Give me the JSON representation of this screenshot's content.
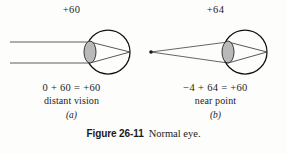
{
  "figure": {
    "number_label": "Figure 26-11",
    "caption_text": "Normal eye.",
    "colors": {
      "ink": "#1c1c1c",
      "outline": "#111111",
      "ray": "#4a4a4a",
      "lens_fill": "#b9b9b9",
      "lens_stroke": "#3a3a3a",
      "page_background": "#fdfdfc"
    }
  },
  "panels": [
    {
      "id": "a",
      "letter": "(a)",
      "power_label": "+60",
      "equation": "0 + 60 = +60",
      "subcaption": "distant vision",
      "ray_source": "parallel-rays",
      "geometry": {
        "eye_center_x": 108,
        "eye_center_y": 32,
        "eye_radius": 22,
        "lens_center_x": 90,
        "lens_rx": 6,
        "lens_ry": 11,
        "focus_x": 130,
        "focus_y": 32,
        "ray_y_top": 22,
        "ray_y_bottom": 43,
        "ray_start_x": 10
      }
    },
    {
      "id": "b",
      "letter": "(b)",
      "power_label": "+64",
      "equation": "−4 + 64 = +60",
      "subcaption": "near point",
      "ray_source": "point-source",
      "geometry": {
        "eye_center_x": 101,
        "eye_center_y": 32,
        "eye_radius": 22,
        "lens_center_x": 84,
        "lens_rx": 6,
        "lens_ry": 11,
        "focus_x": 123,
        "focus_y": 32,
        "source_x": 7,
        "source_y": 32,
        "ray_y_top": 22,
        "ray_y_bottom": 43
      }
    }
  ]
}
